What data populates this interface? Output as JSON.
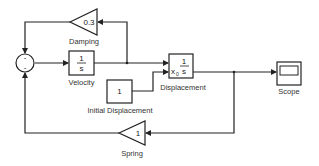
{
  "diagram": {
    "type": "simulink-model",
    "colors": {
      "line": "#222222",
      "text": "#333333",
      "background": "#ffffff"
    },
    "blocks": {
      "damping": {
        "type": "gain",
        "value": "0.3",
        "label": "Damping"
      },
      "sum": {
        "type": "sum",
        "signs": [
          "-",
          "-"
        ]
      },
      "velocity": {
        "type": "integrator",
        "numerator": "1",
        "denominator": "s",
        "label": "Velocity"
      },
      "displacement": {
        "type": "integrator",
        "numerator": "1",
        "denominator": "s",
        "ic_label": "x",
        "ic_sub": "0",
        "label": "Displacement"
      },
      "initial_displacement": {
        "type": "constant",
        "value": "1",
        "label": "Initial Displacement"
      },
      "scope": {
        "type": "scope",
        "label": "Scope"
      },
      "spring": {
        "type": "gain",
        "value": "1",
        "label": "Spring"
      }
    },
    "connections": [
      "sum -> velocity",
      "velocity -> displacement",
      "velocity -> damping",
      "damping -> sum",
      "initial_displacement -> displacement.x0",
      "displacement -> scope",
      "displacement -> spring",
      "spring -> sum"
    ]
  }
}
